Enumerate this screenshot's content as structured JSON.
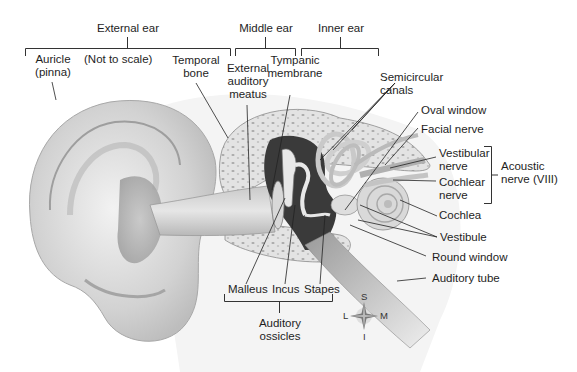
{
  "diagram": {
    "note": "(Not to scale)",
    "regions": [
      {
        "label": "External ear"
      },
      {
        "label": "Middle ear"
      },
      {
        "label": "Inner ear"
      }
    ],
    "labels": {
      "auricle": "Auricle",
      "auricle_sub": "(pinna)",
      "temporal": "Temporal",
      "temporal_sub": "bone",
      "eam1": "External",
      "eam2": "auditory",
      "eam3": "meatus",
      "tymp1": "Tympanic",
      "tymp2": "membrane",
      "semi1": "Semicircular",
      "semi2": "canals",
      "oval_window": "Oval window",
      "facial_nerve": "Facial nerve",
      "vest_nerve1": "Vestibular",
      "vest_nerve2": "nerve",
      "coch_nerve1": "Cochlear",
      "coch_nerve2": "nerve",
      "acoustic1": "Acoustic",
      "acoustic2": "nerve (VIII)",
      "cochlea": "Cochlea",
      "vestibule": "Vestibule",
      "round_window": "Round window",
      "auditory_tube": "Auditory tube",
      "malleus": "Malleus",
      "incus": "Incus",
      "stapes": "Stapes",
      "ossicles1": "Auditory",
      "ossicles2": "ossicles"
    },
    "compass": {
      "superior": "S",
      "inferior": "I",
      "lateral": "L",
      "medial": "M"
    }
  }
}
